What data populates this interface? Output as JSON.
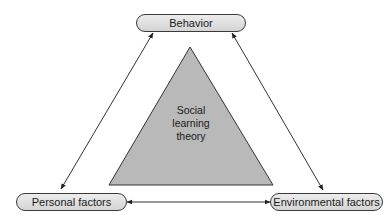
{
  "diagram": {
    "center": {
      "lines": [
        "Social",
        "learning",
        "theory"
      ],
      "fill": "#b9b9b9"
    },
    "nodes": {
      "top": {
        "label": "Behavior"
      },
      "bottom_left": {
        "label": "Personal factors"
      },
      "bottom_right": {
        "label": "Environmental factors"
      }
    },
    "edges": [
      {
        "from": "Behavior",
        "to": "Personal factors",
        "direction": "bidirectional"
      },
      {
        "from": "Behavior",
        "to": "Environmental factors",
        "direction": "bidirectional"
      },
      {
        "from": "Personal factors",
        "to": "Environmental factors",
        "direction": "bidirectional"
      }
    ]
  }
}
